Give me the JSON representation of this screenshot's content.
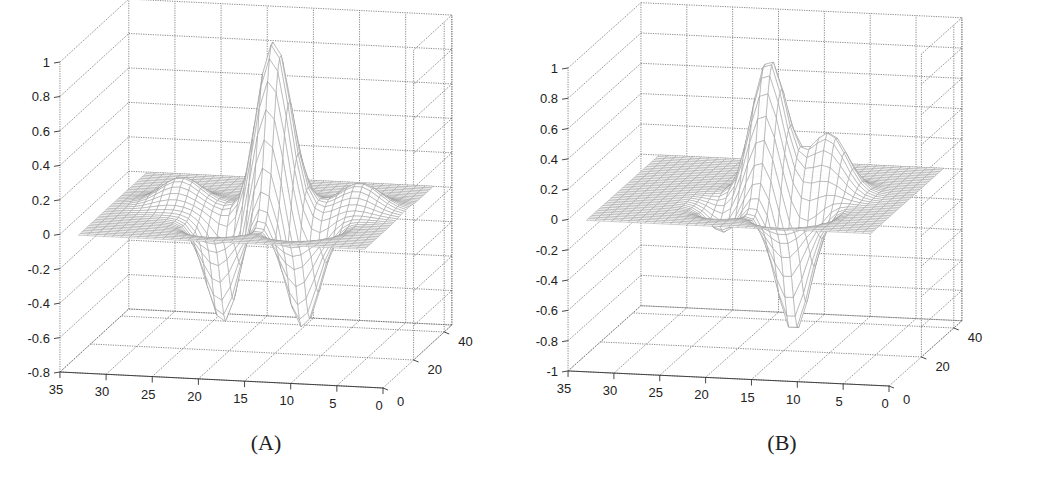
{
  "figure": {
    "panels": [
      {
        "id": "A",
        "caption": "(A)"
      },
      {
        "id": "B",
        "caption": "(B)"
      }
    ]
  },
  "chart_data": [
    {
      "type": "surface",
      "panel": "A",
      "title": "",
      "caption": "(A)",
      "xlabel": "",
      "ylabel": "",
      "zlabel": "",
      "x_ticks": [
        35,
        30,
        25,
        20,
        15,
        10,
        5,
        0
      ],
      "y_ticks": [
        0,
        20,
        40
      ],
      "z_ticks": [
        1,
        0.8,
        0.6,
        0.4,
        0.2,
        0,
        -0.2,
        -0.4,
        -0.6,
        -0.8
      ],
      "xlim": [
        0,
        35
      ],
      "ylim": [
        0,
        45
      ],
      "zlim": [
        -0.8,
        1
      ],
      "grid": true,
      "description": "Mexican-hat-like 2D wavelet surface: central positive peak ~1.0 near x≈15-16, y≈22, with two negative lobes ~-0.6 on either side along x and small positive side ripples ~0.15",
      "features": [
        {
          "kind": "peak",
          "x": 15.5,
          "y": 22,
          "z": 1.0
        },
        {
          "kind": "trough",
          "x": 19.5,
          "y": 14,
          "z": -0.6
        },
        {
          "kind": "trough",
          "x": 11,
          "y": 14,
          "z": -0.6
        },
        {
          "kind": "ripple",
          "x": 26,
          "y": 25,
          "z": 0.15
        },
        {
          "kind": "ripple",
          "x": 7,
          "y": 27,
          "z": 0.15
        }
      ],
      "proj": {
        "ox": 383,
        "oy": 388,
        "ex": -9.23,
        "exy": -0.457,
        "ey": 1.53,
        "eyy": -1.4,
        "ez": -172.2,
        "zmin": -0.8
      }
    },
    {
      "type": "surface",
      "panel": "B",
      "title": "",
      "caption": "(B)",
      "xlabel": "",
      "ylabel": "",
      "zlabel": "",
      "x_ticks": [
        35,
        30,
        25,
        20,
        15,
        10,
        5,
        0
      ],
      "y_ticks": [
        0,
        20,
        40
      ],
      "z_ticks": [
        1,
        0.8,
        0.6,
        0.4,
        0.2,
        0,
        -0.2,
        -0.4,
        -0.6,
        -0.8,
        -1
      ],
      "xlim": [
        0,
        35
      ],
      "ylim": [
        0,
        45
      ],
      "zlim": [
        -1,
        1
      ],
      "grid": true,
      "description": "Asymmetric wavelet surface: positive peak ~0.9 near x≈17, y≈22, a secondary positive bump ~0.4, a shallow negative lobe ~-0.2 and a deep negative lobe ~-0.8",
      "features": [
        {
          "kind": "peak",
          "x": 17,
          "y": 22,
          "z": 0.9
        },
        {
          "kind": "bump",
          "x": 11,
          "y": 25,
          "z": 0.4
        },
        {
          "kind": "trough",
          "x": 20,
          "y": 14,
          "z": -0.2
        },
        {
          "kind": "trough",
          "x": 12.5,
          "y": 12,
          "z": -0.8
        }
      ],
      "proj": {
        "ox": 359,
        "oy": 386,
        "ex": -9.17,
        "exy": -0.43,
        "ey": 1.62,
        "eyy": -1.45,
        "ez": -151.5,
        "zmin": -1
      }
    }
  ]
}
